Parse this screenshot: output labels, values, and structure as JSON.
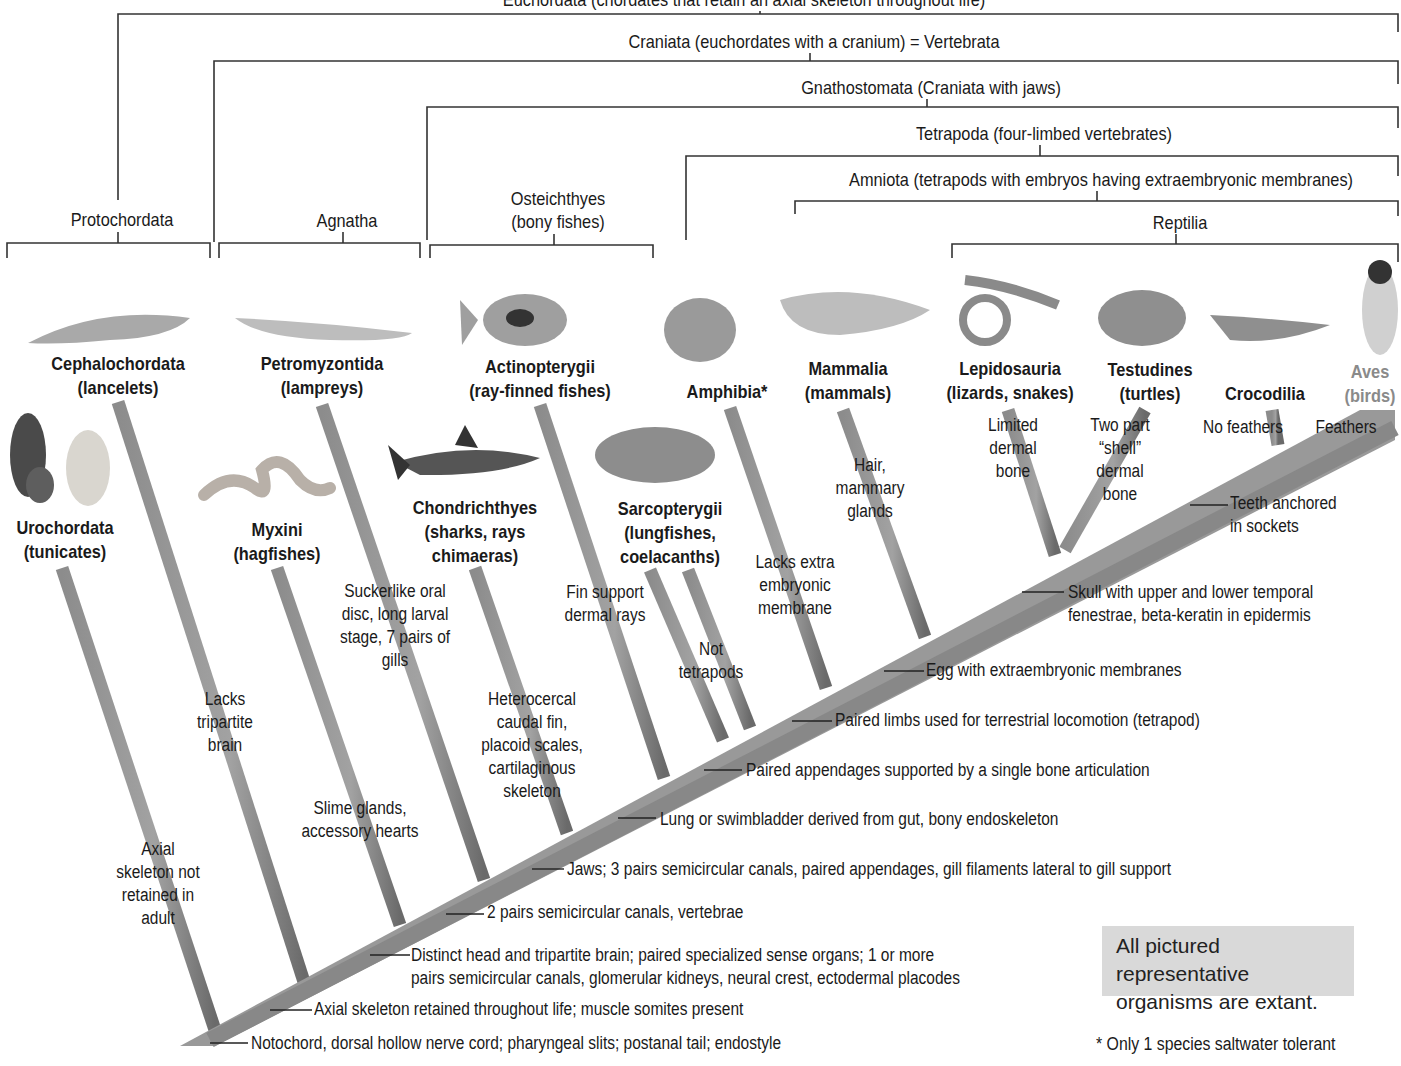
{
  "diagram": {
    "type": "cladogram"
  },
  "clade_brackets": [
    {
      "label": "Euchordata (chordates that retain an axial skeleton throughout life)",
      "partially_visible": true
    },
    {
      "label": "Craniata (euchordates with a cranium) = Vertebrata"
    },
    {
      "label": "Gnathostomata (Craniata with jaws)"
    },
    {
      "label": "Tetrapoda (four-limbed vertebrates)"
    },
    {
      "label": "Amniota (tetrapods with embryos having extraembryonic membranes)"
    },
    {
      "label": "Reptilia"
    }
  ],
  "paraphyletic_groups": [
    {
      "label": "Protochordata"
    },
    {
      "label": "Agnatha"
    },
    {
      "label": "Osteichthyes",
      "sublabel": "(bony fishes)"
    }
  ],
  "taxa": [
    {
      "name": "Urochordata",
      "common": "(tunicates)"
    },
    {
      "name": "Cephalochordata",
      "common": "(lancelets)"
    },
    {
      "name": "Myxini",
      "common": "(hagfishes)"
    },
    {
      "name": "Petromyzontida",
      "common": "(lampreys)"
    },
    {
      "name": "Chondrichthyes",
      "common": "(sharks, rays",
      "common2": "chimaeras)"
    },
    {
      "name": "Actinopterygii",
      "common": "(ray-finned fishes)"
    },
    {
      "name": "Sarcopterygii",
      "common": "(lungfishes,",
      "common2": "coelacanths)"
    },
    {
      "name": "Amphibia*"
    },
    {
      "name": "Mammalia",
      "common": "(mammals)"
    },
    {
      "name": "Lepidosauria",
      "common": "(lizards, snakes)"
    },
    {
      "name": "Testudines",
      "common": "(turtles)"
    },
    {
      "name": "Crocodilia"
    },
    {
      "name": "Aves",
      "common": "(birds)"
    }
  ],
  "branch_notes": {
    "urochordata": [
      "Axial",
      "skeleton not",
      "retained in",
      "adult"
    ],
    "cephalochordata": [
      "Lacks",
      "tripartite",
      "brain"
    ],
    "myxini": [
      "Slime glands,",
      "accessory hearts"
    ],
    "petromyzontida": [
      "Suckerlike oral",
      "disc, long larval",
      "stage, 7 pairs of",
      "gills"
    ],
    "chondrichthyes": [
      "Heterocercal",
      "caudal fin,",
      "placoid scales,",
      "cartilaginous",
      "skeleton"
    ],
    "actinopterygii": [
      "Fin support",
      "dermal rays"
    ],
    "sarcopterygii": [
      "Not",
      "tetrapods"
    ],
    "amphibia": [
      "Lacks extra",
      "embryonic",
      "membrane"
    ],
    "mammalia": [
      "Hair,",
      "mammary",
      "glands"
    ],
    "lepidosauria": [
      "Limited",
      "dermal",
      "bone"
    ],
    "testudines": [
      "Two part",
      "“shell”",
      "dermal",
      "bone"
    ],
    "crocodilia": [
      "No feathers"
    ],
    "aves": [
      "Feathers"
    ]
  },
  "trunk_characters": [
    {
      "text": "Notochord, dorsal hollow nerve cord; pharyngeal slits; postanal tail; endostyle"
    },
    {
      "text": "Axial skeleton retained throughout life; muscle somites present"
    },
    {
      "text": "Distinct head and tripartite brain; paired specialized sense organs; 1 or more",
      "text2": "pairs semicircular canals, glomerular kidneys, neural crest, ectodermal placodes"
    },
    {
      "text": "2 pairs semicircular canals, vertebrae"
    },
    {
      "text": "Jaws; 3 pairs semicircular canals, paired appendages, gill filaments lateral to gill support"
    },
    {
      "text": "Lung or swimbladder derived from gut, bony endoskeleton"
    },
    {
      "text": "Paired appendages supported by a single bone articulation"
    },
    {
      "text": "Paired limbs used for terrestrial locomotion (tetrapod)"
    },
    {
      "text": "Egg with extraembryonic membranes"
    },
    {
      "text": "Skull with upper and lower temporal",
      "text2": "fenestrae, beta-keratin in epidermis"
    },
    {
      "text": "Teeth anchored",
      "text2": "in sockets"
    }
  ],
  "callout_box": {
    "line1": "All pictured representative",
    "line2": "organisms are extant."
  },
  "footnote": "* Only 1 species saltwater tolerant",
  "colors": {
    "branch": "#9a9a9a",
    "branch_shadow": "#6e6e6e",
    "bracket": "#333333",
    "callout_bg": "#d9d9d9",
    "aves_label": "#8a8a8a"
  }
}
